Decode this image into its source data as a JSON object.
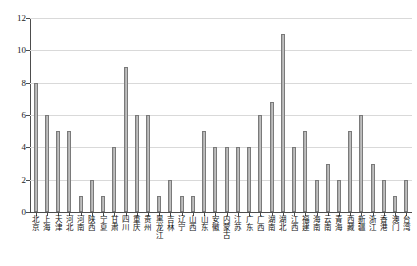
{
  "chart_data": {
    "type": "bar",
    "title": "",
    "xlabel": "",
    "ylabel": "",
    "ylim": [
      0,
      12
    ],
    "yticks": [
      0,
      2,
      4,
      6,
      8,
      10,
      12
    ],
    "grid": true,
    "legend": "none",
    "categories": [
      "北京",
      "上海",
      "天津",
      "河北",
      "河南",
      "陕西",
      "宁夏",
      "甘肃",
      "四川",
      "重庆",
      "贵州",
      "黑龙江",
      "吉林",
      "辽宁",
      "山西",
      "山东",
      "安徽",
      "内蒙古",
      "江苏",
      "广东",
      "广西",
      "湖南",
      "湖北",
      "江西",
      "福建",
      "海南",
      "云南",
      "青海",
      "西藏",
      "新疆",
      "浙江",
      "香港",
      "澳门",
      "台湾"
    ],
    "values": [
      8,
      6,
      5,
      5,
      1,
      2,
      1,
      4,
      9,
      6,
      6,
      1,
      2,
      1,
      1,
      5,
      4,
      4,
      4,
      4,
      6,
      6.8,
      11,
      4,
      5,
      2,
      3,
      2,
      5,
      6,
      3,
      2,
      1,
      2
    ],
    "series": [
      {
        "name": "数量",
        "values": [
          8,
          6,
          5,
          5,
          1,
          2,
          1,
          4,
          9,
          6,
          6,
          1,
          2,
          1,
          1,
          5,
          4,
          4,
          4,
          4,
          6,
          6.8,
          11,
          4,
          5,
          2,
          3,
          2,
          5,
          6,
          3,
          2,
          1,
          2
        ]
      }
    ],
    "colors": {
      "bar_fill": "#bdbdbd",
      "bar_edge": "#7a7a7a",
      "grid": "#d9d9d9",
      "axis": "#4d4d4d",
      "text": "#111111",
      "background": "#ffffff"
    }
  }
}
